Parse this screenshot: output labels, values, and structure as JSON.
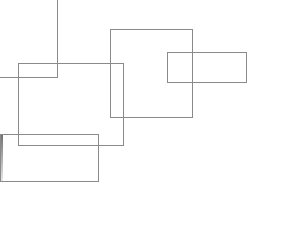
{
  "diagram": {
    "background": "#ffffff",
    "stroke_color": "#8a8a8a",
    "edge_strip": {
      "x": 0,
      "y": 134,
      "w": 3,
      "h": 47,
      "gradient": [
        "#6e6e6e",
        "#e8e8e8"
      ]
    },
    "lines": [
      {
        "id": "vertical-line",
        "x": 57,
        "y": 0,
        "w": 1,
        "h": 78
      },
      {
        "id": "horizontal-line",
        "x": 0,
        "y": 77,
        "w": 58,
        "h": 1
      }
    ],
    "rectangles": [
      {
        "id": "rect-b",
        "x": 18,
        "y": 63,
        "w": 106,
        "h": 83
      },
      {
        "id": "rect-c",
        "x": 110,
        "y": 29,
        "w": 83,
        "h": 89
      },
      {
        "id": "rect-d",
        "x": 167,
        "y": 52,
        "w": 80,
        "h": 31
      },
      {
        "id": "rect-e",
        "x": 0,
        "y": 134,
        "w": 99,
        "h": 48
      }
    ]
  }
}
